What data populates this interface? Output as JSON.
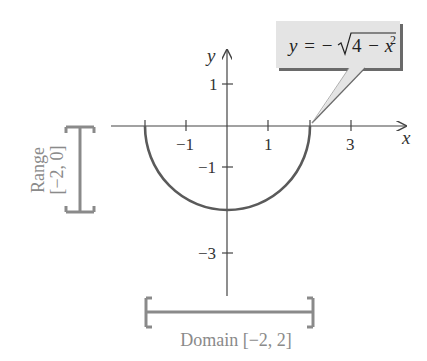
{
  "figure": {
    "type": "graph of function with domain and range",
    "equation": {
      "lhs": "y",
      "equals": "=",
      "sign": "−",
      "radicand_const": "4",
      "radicand_op": "−",
      "radicand_var": "x",
      "exponent": "2",
      "full_text": "y = −√(4 − x²)"
    },
    "axes": {
      "x_label": "x",
      "y_label": "y",
      "x_ticks": [
        {
          "value": -1,
          "label": "−1"
        },
        {
          "value": 1,
          "label": "1"
        },
        {
          "value": 3,
          "label": "3"
        }
      ],
      "y_ticks": [
        {
          "value": 1,
          "label": "1"
        },
        {
          "value": -1,
          "label": "−1"
        },
        {
          "value": -3,
          "label": "−3"
        }
      ]
    },
    "curve": {
      "description": "lower semicircle of radius 2 centered at origin",
      "x_start": -2,
      "x_end": 2,
      "min_y": -2
    },
    "range_bracket": {
      "title": "Range",
      "interval": "[−2, 0]"
    },
    "domain_bracket": {
      "title": "Domain",
      "interval": "[−2, 2]",
      "label": "Domain [−2, 2]"
    },
    "colors": {
      "axes": "#444444",
      "curve": "#5a5a5a",
      "bracket": "#8a8a8a",
      "callout_fill": "#e4e4e4",
      "callout_shadow": "#6a6a6a"
    }
  }
}
